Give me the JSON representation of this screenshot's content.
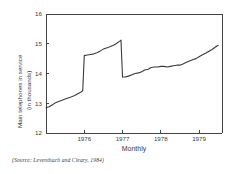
{
  "figure": {
    "source_note": "(Source: Leventhach and Cleary, 1984)"
  },
  "chart_data": {
    "type": "line",
    "title": "",
    "xlabel": "Monthly",
    "ylabel": "Main telephones in service (in thousands)",
    "ylabel_line1": "Main telephones in service",
    "ylabel_line2": "(in thousands)",
    "ylim": [
      12,
      16
    ],
    "xlim": [
      1975.0,
      1979.6
    ],
    "yticks": [
      12,
      13,
      14,
      15,
      16
    ],
    "ytick_labels": [
      "12",
      "13",
      "14",
      "15",
      "16"
    ],
    "xticks": [
      1976,
      1977,
      1978,
      1979
    ],
    "xtick_labels": [
      "1976",
      "1977",
      "1978",
      "1979"
    ],
    "grid": false,
    "legend": "none",
    "series": [
      {
        "name": "Main telephones in service",
        "x": [
          1975.0,
          1975.08,
          1975.17,
          1975.25,
          1975.33,
          1975.42,
          1975.5,
          1975.58,
          1975.67,
          1975.75,
          1975.83,
          1975.92,
          1975.96,
          1976.0,
          1976.08,
          1976.17,
          1976.25,
          1976.33,
          1976.42,
          1976.5,
          1976.58,
          1976.67,
          1976.75,
          1976.83,
          1976.92,
          1976.96,
          1977.0,
          1977.08,
          1977.17,
          1977.25,
          1977.33,
          1977.42,
          1977.5,
          1977.58,
          1977.67,
          1977.75,
          1977.83,
          1977.92,
          1978.0,
          1978.08,
          1978.17,
          1978.25,
          1978.33,
          1978.42,
          1978.5,
          1978.58,
          1978.67,
          1978.75,
          1978.83,
          1978.92,
          1979.0,
          1979.08,
          1979.17,
          1979.25,
          1979.33,
          1979.42,
          1979.5
        ],
        "y": [
          12.85,
          12.88,
          12.95,
          13.02,
          13.06,
          13.1,
          13.14,
          13.18,
          13.22,
          13.26,
          13.32,
          13.38,
          13.42,
          14.6,
          14.62,
          14.64,
          14.66,
          14.7,
          14.76,
          14.82,
          14.86,
          14.9,
          14.94,
          15.0,
          15.08,
          15.12,
          13.88,
          13.88,
          13.92,
          13.96,
          14.0,
          14.02,
          14.06,
          14.12,
          14.14,
          14.2,
          14.22,
          14.22,
          14.24,
          14.24,
          14.22,
          14.24,
          14.26,
          14.28,
          14.28,
          14.32,
          14.38,
          14.42,
          14.46,
          14.5,
          14.56,
          14.62,
          14.68,
          14.74,
          14.8,
          14.88,
          14.95
        ]
      }
    ]
  }
}
